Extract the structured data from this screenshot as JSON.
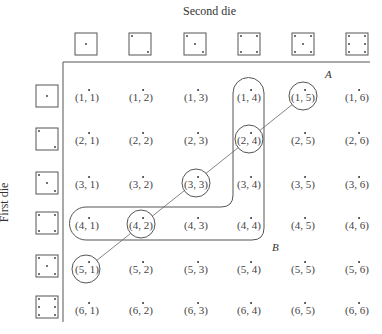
{
  "axes": {
    "top_label": "Second die",
    "left_label": "First die"
  },
  "dice_faces": [
    1,
    2,
    3,
    4,
    5,
    6
  ],
  "grid": [
    [
      "(1, 1)",
      "(1, 2)",
      "(1, 3)",
      "(1, 4)",
      "(1, 5)",
      "(1, 6)"
    ],
    [
      "(2, 1)",
      "(2, 2)",
      "(2, 3)",
      "(2, 4)",
      "(2, 5)",
      "(2, 6)"
    ],
    [
      "(3, 1)",
      "(3, 2)",
      "(3, 3)",
      "(3, 4)",
      "(3, 5)",
      "(3, 6)"
    ],
    [
      "(4, 1)",
      "(4, 2)",
      "(4, 3)",
      "(4, 4)",
      "(4, 5)",
      "(4, 6)"
    ],
    [
      "(5, 1)",
      "(5, 2)",
      "(5, 3)",
      "(5, 4)",
      "(5, 5)",
      "(5, 6)"
    ],
    [
      "(6, 1)",
      "(6, 2)",
      "(6, 3)",
      "(6, 4)",
      "(6, 5)",
      "(6, 6)"
    ]
  ],
  "events": {
    "A": {
      "label": "A",
      "description": "Sum equals 6",
      "outcomes": [
        "(1, 5)",
        "(2, 4)",
        "(3, 3)",
        "(4, 2)",
        "(5, 1)"
      ]
    },
    "B": {
      "label": "B",
      "description": "Row 4 (cols 1-4) and column 4 (rows 1-4) region",
      "outcomes": [
        "(1, 4)",
        "(2, 4)",
        "(3, 4)",
        "(4, 4)",
        "(4, 1)",
        "(4, 2)",
        "(4, 3)"
      ]
    }
  },
  "colors": {
    "line": "#555555",
    "text": "#333333",
    "background": "#ffffff"
  }
}
